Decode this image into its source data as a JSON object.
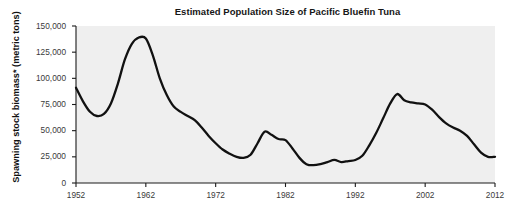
{
  "chart_data": {
    "type": "line",
    "title": "Estimated Population Size of Pacific Bluefin Tuna",
    "xlabel": "",
    "ylabel": "Spawning stock biomass* (metric tons)",
    "xlim": [
      1952,
      2012
    ],
    "ylim": [
      0,
      150000
    ],
    "grid": false,
    "legend": "none",
    "xticks": [
      "1952",
      "1962",
      "1972",
      "1982",
      "1992",
      "2002",
      "2012"
    ],
    "xtick_values": [
      1952,
      1962,
      1972,
      1982,
      1992,
      2002,
      2012
    ],
    "yticks": [
      "0",
      "25,000",
      "50,000",
      "75,000",
      "100,000",
      "125,000",
      "150,000"
    ],
    "ytick_values": [
      0,
      25000,
      50000,
      75000,
      100000,
      125000,
      150000
    ],
    "series": [
      {
        "name": "Spawning stock biomass",
        "color": "#111111",
        "x": [
          1952,
          1953,
          1954,
          1955,
          1956,
          1957,
          1958,
          1959,
          1960,
          1961,
          1962,
          1963,
          1964,
          1965,
          1966,
          1967,
          1968,
          1969,
          1970,
          1971,
          1972,
          1973,
          1974,
          1975,
          1976,
          1977,
          1978,
          1979,
          1980,
          1981,
          1982,
          1983,
          1984,
          1985,
          1986,
          1987,
          1988,
          1989,
          1990,
          1991,
          1992,
          1993,
          1994,
          1995,
          1996,
          1997,
          1998,
          1999,
          2000,
          2001,
          2002,
          2003,
          2004,
          2005,
          2006,
          2007,
          2008,
          2009,
          2010,
          2011,
          2012
        ],
        "values": [
          91000,
          78000,
          68000,
          64000,
          66000,
          76000,
          95000,
          118000,
          133000,
          139000,
          138000,
          122000,
          100000,
          84000,
          73000,
          68000,
          64000,
          60000,
          53000,
          45000,
          38000,
          32000,
          28000,
          25000,
          24000,
          27000,
          38000,
          49000,
          46000,
          42000,
          41000,
          33000,
          24000,
          18000,
          17000,
          18000,
          20000,
          22000,
          20000,
          21000,
          22000,
          26000,
          36000,
          48000,
          62000,
          76000,
          85000,
          79000,
          77000,
          76000,
          75000,
          70000,
          63000,
          57000,
          53000,
          50000,
          45000,
          37000,
          29000,
          25000,
          25000
        ]
      }
    ]
  },
  "axes": {
    "y_title": "Spawning stock biomass* (metric tons)"
  }
}
